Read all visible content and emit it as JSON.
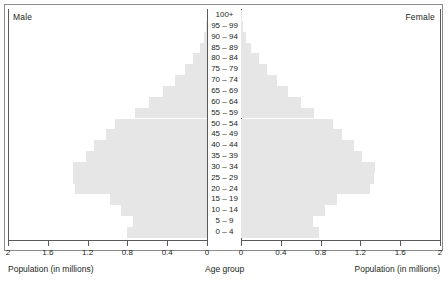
{
  "labels": {
    "male": "Male",
    "female": "Female",
    "axis_title_left": "Population (in millions)",
    "axis_title_right": "Population (in millions)",
    "axis_title_center": "Age group"
  },
  "colors": {
    "bar": "#e6e6e6",
    "axis": "#5a5a5a",
    "text": "#231f20",
    "frame": "#8c8c8c",
    "background": "#ffffff"
  },
  "ticks": {
    "left": [
      "2",
      "1.6",
      "1.2",
      "0.8",
      "0.4",
      "0"
    ],
    "right": [
      "0",
      "0.4",
      "0.8",
      "1.2",
      "1.6",
      "2"
    ]
  },
  "chart_data": {
    "type": "bar",
    "title": "",
    "subtitle": "",
    "orientation": "horizontal",
    "layout": "population-pyramid",
    "xlabel": "Population (in millions)",
    "ylabel": "Age group",
    "xlim": [
      0,
      2
    ],
    "grid": false,
    "legend_position": "top-corners",
    "categories": [
      "100+",
      "95 – 99",
      "90 – 94",
      "85 – 89",
      "80 – 84",
      "75 – 79",
      "70 – 74",
      "65 – 69",
      "60 – 64",
      "55 – 59",
      "50 – 54",
      "45 – 49",
      "40 – 44",
      "35 – 39",
      "30 – 34",
      "25 – 29",
      "20 – 24",
      "15 – 19",
      "10 – 14",
      "5 – 9",
      "0 – 4"
    ],
    "series": [
      {
        "name": "Male",
        "side": "left",
        "values": [
          0.0,
          0.01,
          0.03,
          0.07,
          0.14,
          0.22,
          0.32,
          0.44,
          0.58,
          0.72,
          0.92,
          1.02,
          1.14,
          1.22,
          1.35,
          1.35,
          1.33,
          0.98,
          0.86,
          0.74,
          0.8
        ]
      },
      {
        "name": "Female",
        "side": "right",
        "values": [
          0.01,
          0.02,
          0.05,
          0.1,
          0.18,
          0.26,
          0.36,
          0.47,
          0.6,
          0.73,
          0.92,
          1.02,
          1.14,
          1.22,
          1.35,
          1.34,
          1.3,
          0.96,
          0.84,
          0.72,
          0.78
        ]
      }
    ]
  }
}
